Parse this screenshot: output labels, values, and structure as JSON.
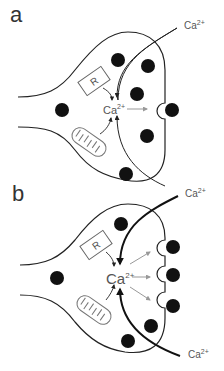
{
  "panels": [
    {
      "label": "a",
      "external_ca": "Ca",
      "external_ca_sup": "2+",
      "internal_ca": "Ca",
      "internal_ca_sup": "2+",
      "receptor_label": "R"
    },
    {
      "label": "b",
      "external_ca_top": "Ca",
      "external_ca_top_sup": "2+",
      "external_ca_bottom": "Ca",
      "external_ca_bottom_sup": "2+",
      "internal_ca": "Ca",
      "internal_ca_sup": "2+",
      "receptor_label": "R"
    }
  ],
  "colors": {
    "line": "#222222",
    "vesicle": "#111111",
    "text": "#555555",
    "arrow_gray": "#999999"
  }
}
